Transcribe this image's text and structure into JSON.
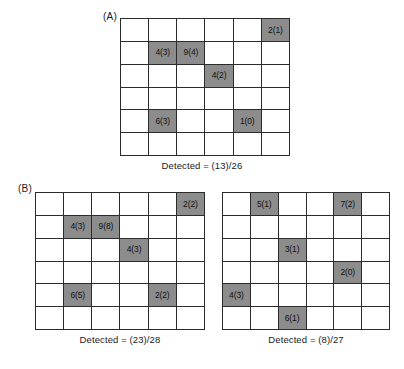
{
  "figure": {
    "background_color": "#ffffff",
    "filled_cell_color": "#8c8c8c",
    "grid_line_color": "#2b2b2b"
  },
  "panels": [
    {
      "id": "A",
      "label": "(A)",
      "grids": [
        {
          "id": "a",
          "rows": 6,
          "cols": 6,
          "caption": "Detected = (13)/26",
          "cells": [
            {
              "row": 1,
              "col": 6,
              "label": "2(1)"
            },
            {
              "row": 2,
              "col": 2,
              "label": "4(3)"
            },
            {
              "row": 2,
              "col": 3,
              "label": "9(4)"
            },
            {
              "row": 3,
              "col": 4,
              "label": "4(2)"
            },
            {
              "row": 5,
              "col": 2,
              "label": "6(3)"
            },
            {
              "row": 5,
              "col": 5,
              "label": "1(0)"
            }
          ]
        }
      ]
    },
    {
      "id": "B",
      "label": "(B)",
      "grids": [
        {
          "id": "b1",
          "rows": 6,
          "cols": 6,
          "caption": "Detected = (23)/28",
          "cells": [
            {
              "row": 1,
              "col": 6,
              "label": "2(2)"
            },
            {
              "row": 2,
              "col": 2,
              "label": "4(3)"
            },
            {
              "row": 2,
              "col": 3,
              "label": "9(8)"
            },
            {
              "row": 3,
              "col": 4,
              "label": "4(3)"
            },
            {
              "row": 5,
              "col": 2,
              "label": "6(5)"
            },
            {
              "row": 5,
              "col": 5,
              "label": "2(2)"
            }
          ]
        },
        {
          "id": "b2",
          "rows": 6,
          "cols": 6,
          "caption": "Detected = (8)/27",
          "cells": [
            {
              "row": 1,
              "col": 2,
              "label": "5(1)"
            },
            {
              "row": 1,
              "col": 5,
              "label": "7(2)"
            },
            {
              "row": 3,
              "col": 3,
              "label": "3(1)"
            },
            {
              "row": 4,
              "col": 5,
              "label": "2(0)"
            },
            {
              "row": 5,
              "col": 1,
              "label": "4(3)"
            },
            {
              "row": 6,
              "col": 3,
              "label": "6(1)"
            }
          ]
        }
      ]
    }
  ]
}
